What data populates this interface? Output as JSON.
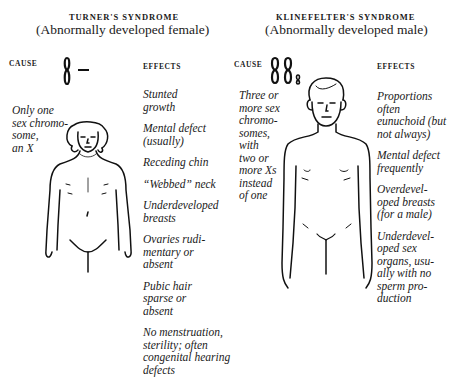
{
  "left": {
    "title": "TURNER'S SYNDROME",
    "subtitle": "(Abnormally developed female)",
    "cause_label": "CAUSE",
    "effects_label": "EFFECTS",
    "cause_text_lines": [
      "Only one",
      "sex chromo-",
      "some,",
      "an X"
    ],
    "chromosome_glyph": "single X chromosome with missing partner (dash)",
    "effects": [
      {
        "lines": [
          "Stunted",
          "growth"
        ]
      },
      {
        "lines": [
          "Mental defect",
          "(usually)"
        ]
      },
      {
        "lines": [
          "Receding chin"
        ]
      },
      {
        "lines": [
          "“Webbed” neck"
        ]
      },
      {
        "lines": [
          "Underdeveloped",
          "breasts"
        ]
      },
      {
        "lines": [
          "Ovaries rudi-",
          "mentary or",
          "absent"
        ]
      },
      {
        "lines": [
          "Pubic hair",
          "sparse or",
          "absent"
        ]
      },
      {
        "lines": [
          "No menstruation,",
          "sterility; often",
          "congenital hearing",
          "defects"
        ]
      }
    ],
    "figure": "female-figure-icon"
  },
  "right": {
    "title": "KLINEFELTER'S SYNDROME",
    "subtitle": "(Abnormally developed male)",
    "cause_label": "CAUSE",
    "effects_label": "EFFECTS",
    "cause_text_lines": [
      "Three or",
      "more sex",
      "chromo-",
      "somes,",
      "with",
      "two or",
      "more Xs",
      "instead",
      "of one"
    ],
    "chromosome_glyph": "two X chromosomes plus small Y",
    "effects": [
      {
        "lines": [
          "Proportions",
          "often",
          "eunuchoid (but",
          "not always)"
        ]
      },
      {
        "lines": [
          "Mental defect",
          "frequently"
        ]
      },
      {
        "lines": [
          "Overdevel-",
          "oped breasts",
          "(for a male)"
        ]
      },
      {
        "lines": [
          "Underdevel-",
          "oped sex",
          "organs, usu-",
          "ally with no",
          "sperm pro-",
          "duction"
        ]
      }
    ],
    "figure": "male-figure-icon"
  }
}
